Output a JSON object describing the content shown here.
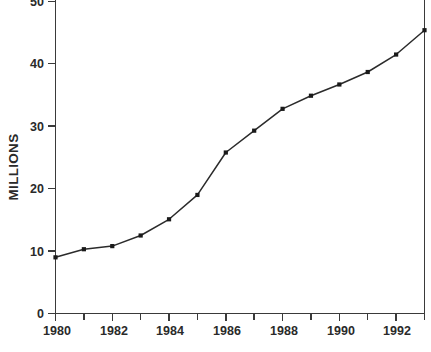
{
  "chart_data": {
    "type": "line",
    "title": "",
    "subtitle": "",
    "xlabel": "",
    "ylabel": "MILLIONS",
    "x": [
      1980,
      1981,
      1982,
      1983,
      1984,
      1985,
      1986,
      1987,
      1988,
      1989,
      1990,
      1991,
      1992,
      1993
    ],
    "values": [
      9.0,
      10.3,
      10.8,
      12.5,
      15.1,
      19.0,
      25.8,
      29.3,
      32.8,
      34.9,
      36.7,
      38.7,
      41.5,
      45.4
    ],
    "series": [
      {
        "name": "MILLIONS",
        "values": [
          9.0,
          10.3,
          10.8,
          12.5,
          15.1,
          19.0,
          25.8,
          29.3,
          32.8,
          34.9,
          36.7,
          38.7,
          41.5,
          45.4
        ]
      }
    ],
    "xlim": [
      1980,
      1993
    ],
    "ylim": [
      0,
      50
    ],
    "ytick_values": [
      0,
      10,
      20,
      30,
      40,
      50
    ],
    "ytick_labels": [
      "0",
      "10",
      "20",
      "30",
      "40",
      "50"
    ],
    "xtick_values": [
      1980,
      1981,
      1982,
      1983,
      1984,
      1985,
      1986,
      1987,
      1988,
      1989,
      1990,
      1991,
      1992,
      1993
    ],
    "xtick_labels_major": [
      "1980",
      "1982",
      "1984",
      "1986",
      "1988",
      "1990",
      "1992"
    ],
    "xtick_major_values": [
      1980,
      1982,
      1984,
      1986,
      1988,
      1990,
      1992
    ],
    "grid": false,
    "legend": false,
    "legend_position": "none",
    "marker": "square",
    "line_color": "#2b2b2b",
    "marker_color": "#1a1a1a",
    "axis_color": "#3a3a3a",
    "background_color": "#ffffff"
  },
  "axis": {
    "y_label_text": "MILLIONS",
    "y_ticks": [
      {
        "label": "50",
        "value": 50
      },
      {
        "label": "40",
        "value": 40
      },
      {
        "label": "30",
        "value": 30
      },
      {
        "label": "20",
        "value": 20
      },
      {
        "label": "10",
        "value": 10
      },
      {
        "label": "0",
        "value": 0
      }
    ],
    "x_ticks": [
      {
        "label": "1980",
        "value": 1980
      },
      {
        "label": "1982",
        "value": 1982
      },
      {
        "label": "1984",
        "value": 1984
      },
      {
        "label": "1986",
        "value": 1986
      },
      {
        "label": "1988",
        "value": 1988
      },
      {
        "label": "1990",
        "value": 1990
      },
      {
        "label": "1992",
        "value": 1992
      }
    ]
  }
}
